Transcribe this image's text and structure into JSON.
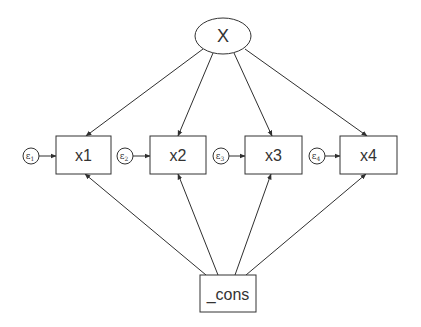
{
  "diagram": {
    "type": "structural-equation-model",
    "latent": {
      "id": "X",
      "label": "X",
      "cx": 223,
      "cy": 36,
      "rx": 28,
      "ry": 18
    },
    "observed": [
      {
        "id": "x1",
        "label": "x1",
        "x": 56,
        "y": 136,
        "w": 55,
        "h": 38
      },
      {
        "id": "x2",
        "label": "x2",
        "x": 150,
        "y": 136,
        "w": 56,
        "h": 38
      },
      {
        "id": "x3",
        "label": "x3",
        "x": 245,
        "y": 136,
        "w": 57,
        "h": 38
      },
      {
        "id": "x4",
        "label": "x4",
        "x": 340,
        "y": 136,
        "w": 57,
        "h": 38
      }
    ],
    "errors": [
      {
        "id": "e1",
        "symbol": "ε",
        "sub": "1",
        "cx": 31,
        "cy": 156,
        "r": 8,
        "target": "x1"
      },
      {
        "id": "e2",
        "symbol": "ε",
        "sub": "2",
        "cx": 125,
        "cy": 156,
        "r": 8,
        "target": "x2"
      },
      {
        "id": "e3",
        "symbol": "ε",
        "sub": "3",
        "cx": 221,
        "cy": 156,
        "r": 8,
        "target": "x3"
      },
      {
        "id": "e4",
        "symbol": "ε",
        "sub": "4",
        "cx": 317,
        "cy": 156,
        "r": 8,
        "target": "x4"
      }
    ],
    "constant": {
      "id": "_cons",
      "label": "_cons",
      "x": 200,
      "y": 275,
      "w": 56,
      "h": 37
    },
    "paths": [
      {
        "from": "X",
        "to": "x1",
        "x1": 203,
        "y1": 49,
        "x2": 86,
        "y2": 136
      },
      {
        "from": "X",
        "to": "x2",
        "x1": 213,
        "y1": 53,
        "x2": 178,
        "y2": 136
      },
      {
        "from": "X",
        "to": "x3",
        "x1": 234,
        "y1": 53,
        "x2": 272,
        "y2": 136
      },
      {
        "from": "X",
        "to": "x4",
        "x1": 245,
        "y1": 49,
        "x2": 367,
        "y2": 136
      },
      {
        "from": "_cons",
        "to": "x1",
        "x1": 206,
        "y1": 275,
        "x2": 85,
        "y2": 174
      },
      {
        "from": "_cons",
        "to": "x2",
        "x1": 218,
        "y1": 275,
        "x2": 178,
        "y2": 174
      },
      {
        "from": "_cons",
        "to": "x3",
        "x1": 235,
        "y1": 275,
        "x2": 271,
        "y2": 174
      },
      {
        "from": "_cons",
        "to": "x4",
        "x1": 246,
        "y1": 275,
        "x2": 366,
        "y2": 174
      }
    ],
    "colors": {
      "stroke": "#333333",
      "background": "#ffffff",
      "text": "#333333"
    }
  }
}
